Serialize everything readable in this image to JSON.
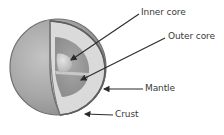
{
  "diagram": {
    "labels": [
      {
        "id": "inner-core",
        "text": "Inner core",
        "x": 141,
        "y": 8
      },
      {
        "id": "outer-core",
        "text": "Outer core",
        "x": 168,
        "y": 32
      },
      {
        "id": "mantle",
        "text": "Mantle",
        "x": 145,
        "y": 84
      },
      {
        "id": "crust",
        "text": "Crust",
        "x": 115,
        "y": 110
      }
    ],
    "colors": {
      "crust": "#6e6e6e",
      "mantle": "#d9d9d9",
      "outer_core": "#9a9a9a",
      "inner_core": "#cfcfcf",
      "sphere_outer": "#a8a8a8",
      "arrow": "#2b2b2b",
      "label_text": "#3a3a3a"
    }
  }
}
